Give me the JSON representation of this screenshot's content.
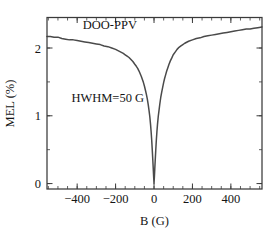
{
  "chart_data": {
    "type": "line",
    "title": "DOO-PPV",
    "xlabel": "B (G)",
    "ylabel": "MEL (%)",
    "xlim": [
      -557,
      562
    ],
    "ylim": [
      -0.08,
      2.45
    ],
    "grid": false,
    "legend": null,
    "xticks": [
      -400,
      -200,
      0,
      200,
      400
    ],
    "xtick_labels": [
      "-400",
      "-200",
      "0",
      "200",
      "400"
    ],
    "yticks": [
      0,
      1,
      2
    ],
    "ytick_labels": [
      "0",
      "1",
      "2"
    ],
    "x_minor_tick_step": 50,
    "y_minor_tick_step": 0.5,
    "annotations": [
      {
        "text": "DOO-PPV",
        "x": -230,
        "y": 2.28
      },
      {
        "text": "HWHM=50 G",
        "x": -430,
        "y": 1.2
      }
    ],
    "series": [
      {
        "name": "MEL vs B",
        "color": "#4a4a4a",
        "hwhm_g": 50,
        "baseline_left_percent": 2.17,
        "baseline_right_percent": 2.3,
        "minimum_percent": 0.0,
        "minimum_at_g": 0,
        "x": [
          -557,
          -540,
          -520,
          -500,
          -480,
          -460,
          -440,
          -420,
          -400,
          -380,
          -360,
          -340,
          -320,
          -300,
          -280,
          -260,
          -240,
          -220,
          -200,
          -180,
          -160,
          -150,
          -140,
          -130,
          -120,
          -110,
          -100,
          -92,
          -85,
          -78,
          -72,
          -66,
          -60,
          -55,
          -50,
          -45,
          -40,
          -35,
          -30,
          -26,
          -22,
          -18,
          -15,
          -12,
          -9,
          -6,
          -4,
          -2,
          0,
          2,
          4,
          6,
          9,
          12,
          15,
          18,
          22,
          26,
          30,
          35,
          40,
          45,
          50,
          55,
          60,
          66,
          72,
          78,
          85,
          92,
          100,
          110,
          120,
          130,
          140,
          150,
          160,
          180,
          200,
          220,
          240,
          260,
          280,
          300,
          320,
          340,
          360,
          380,
          400,
          420,
          440,
          460,
          480,
          500,
          520,
          540,
          562
        ],
        "y": [
          2.17,
          2.17,
          2.16,
          2.16,
          2.14,
          2.13,
          2.12,
          2.12,
          2.11,
          2.1,
          2.09,
          2.08,
          2.07,
          2.06,
          2.05,
          2.03,
          2.02,
          2.0,
          1.98,
          1.95,
          1.92,
          1.9,
          1.88,
          1.86,
          1.83,
          1.8,
          1.76,
          1.73,
          1.7,
          1.66,
          1.62,
          1.58,
          1.53,
          1.49,
          1.44,
          1.38,
          1.32,
          1.25,
          1.16,
          1.08,
          0.99,
          0.87,
          0.76,
          0.64,
          0.49,
          0.33,
          0.22,
          0.1,
          0.0,
          0.1,
          0.22,
          0.33,
          0.49,
          0.64,
          0.76,
          0.87,
          0.99,
          1.08,
          1.17,
          1.27,
          1.35,
          1.42,
          1.49,
          1.55,
          1.6,
          1.66,
          1.71,
          1.76,
          1.81,
          1.85,
          1.9,
          1.94,
          1.98,
          2.01,
          2.03,
          2.05,
          2.07,
          2.1,
          2.12,
          2.14,
          2.15,
          2.17,
          2.18,
          2.19,
          2.2,
          2.21,
          2.22,
          2.23,
          2.24,
          2.25,
          2.26,
          2.27,
          2.28,
          2.28,
          2.29,
          2.3,
          2.31
        ]
      }
    ]
  },
  "figure": {
    "title_label": "DOO-PPV",
    "annotation_label": "HWHM=50 G",
    "x_axis_title": "B (G)",
    "y_axis_title": "MEL (%)",
    "xtick_labels": [
      "-400",
      "-200",
      "0",
      "200",
      "400"
    ],
    "ytick_labels": [
      "0",
      "1",
      "2"
    ]
  }
}
